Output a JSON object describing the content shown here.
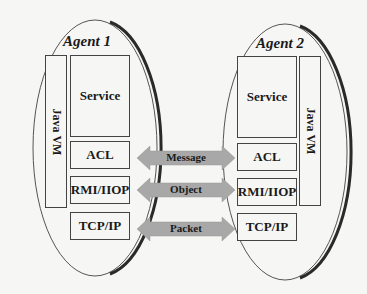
{
  "diagram": {
    "colors": {
      "background": "#f6f6f4",
      "stroke": "#333333",
      "arrow_fill": "#a8a8a8"
    },
    "agents": [
      {
        "title": "Agent 1",
        "vm_label": "Java VM",
        "layers": [
          "Service",
          "ACL",
          "RMI/IIOP",
          "TCP/IP"
        ]
      },
      {
        "title": "Agent 2",
        "vm_label": "Java VM",
        "layers": [
          "Service",
          "ACL",
          "RMI/IIOP",
          "TCP/IP"
        ]
      }
    ],
    "arrows": [
      {
        "label": "Message",
        "between": "ACL"
      },
      {
        "label": "Object",
        "between": "RMI/IIOP"
      },
      {
        "label": "Packet",
        "between": "TCP/IP"
      }
    ]
  }
}
